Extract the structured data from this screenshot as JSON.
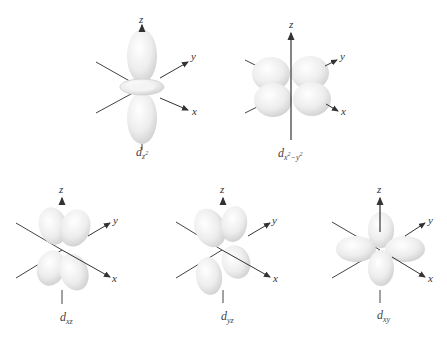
{
  "figure": {
    "axis_labels": {
      "x": "x",
      "y": "y",
      "z": "z"
    },
    "orbitals": [
      {
        "name": "dz2",
        "label_main": "d",
        "label_sub": "z",
        "label_sup": "2"
      },
      {
        "name": "dx2-y2",
        "label_main": "d",
        "label_sub": "x",
        "label_sup1": "2",
        "label_mid": "−y",
        "label_sup2": "2"
      },
      {
        "name": "dxz",
        "label_main": "d",
        "label_sub": "xz"
      },
      {
        "name": "dyz",
        "label_main": "d",
        "label_sub": "yz"
      },
      {
        "name": "dxy",
        "label_main": "d",
        "label_sub": "xy"
      }
    ],
    "colors": {
      "lobe": "#ececec",
      "lobe_edge": "#d4d4d4",
      "axis": "#333333",
      "background": "#ffffff"
    }
  }
}
